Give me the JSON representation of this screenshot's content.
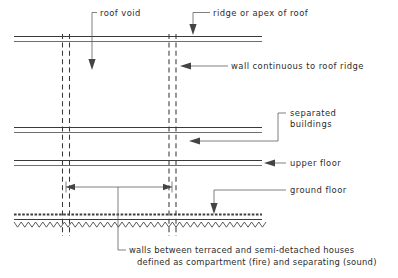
{
  "diagram": {
    "colors": {
      "line": "#3a3a3a",
      "leader": "#555555",
      "text": "#2b2b2b",
      "background": "#ffffff"
    },
    "labels": {
      "roof_void": "roof void",
      "ridge_apex": "ridge or apex of roof",
      "wall_continuous": "wall continuous to roof ridge",
      "separated_buildings_line1": "separated",
      "separated_buildings_line2": "buildings",
      "upper_floor": "upper floor",
      "ground_floor": "ground floor",
      "caption_line1": "walls between terraced and semi-detached houses",
      "caption_line2": "defined as compartment (fire) and separating (sound)"
    },
    "structure": {
      "roof_label": "roof / ridge line",
      "ceiling_label": "ceiling line",
      "upper_floor_label": "upper floor slab",
      "ground_floor_label": "ground floor slab with hardcore",
      "wall_left_label": "separating wall left",
      "wall_right_label": "separating wall right",
      "dimension_label": "span between separating walls"
    }
  }
}
